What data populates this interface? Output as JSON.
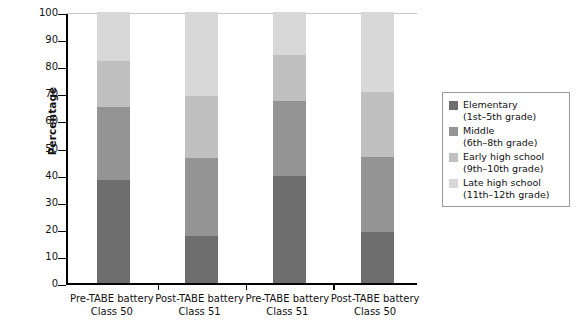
{
  "chart_data": {
    "type": "bar",
    "subtype": "stacked-percentage",
    "title": "",
    "xlabel": "",
    "ylabel": "Percentage",
    "ylim": [
      0,
      100
    ],
    "ytick_step": 10,
    "yticks": [
      0,
      10,
      20,
      30,
      40,
      50,
      60,
      70,
      80,
      90,
      100
    ],
    "ytick_labels": [
      "0",
      "10",
      "20",
      "30",
      "40",
      "50",
      "60",
      "70",
      "80",
      "90",
      "100"
    ],
    "grid": false,
    "legend_position": "right",
    "categories": [
      "Pre-TABE battery Class 50",
      "Post-TABE battery Class 51",
      "Pre-TABE battery Class 51",
      "Post-TABE battery Class 50"
    ],
    "category_lines": [
      [
        "Pre-TABE battery",
        "Class 50"
      ],
      [
        "Post-TABE battery",
        "Class 51"
      ],
      [
        "Pre-TABE battery",
        "Class 51"
      ],
      [
        "Post-TABE battery",
        "Class 50"
      ]
    ],
    "series": [
      {
        "name": "Elementary (1st–5th grade)",
        "color": "#6e6e6e",
        "values": [
          38,
          17.5,
          39.5,
          19
        ]
      },
      {
        "name": "Middle (6th–8th grade)",
        "color": "#949494",
        "values": [
          27,
          28.5,
          27.5,
          27.5
        ]
      },
      {
        "name": "Early high school (9th–10th grade)",
        "color": "#c0c0c0",
        "values": [
          17,
          23,
          17,
          24
        ]
      },
      {
        "name": "Late high school (11th–12th grade)",
        "color": "#d8d8d8",
        "values": [
          18,
          31,
          16,
          29.5
        ]
      }
    ]
  },
  "legend": {
    "items": [
      {
        "swatch_name": "legend-swatch-elementary",
        "color": "#6e6e6e",
        "line1": "Elementary",
        "line2": "(1st–5th grade)"
      },
      {
        "swatch_name": "legend-swatch-middle",
        "color": "#949494",
        "line1": "Middle",
        "line2": "(6th–8th grade)"
      },
      {
        "swatch_name": "legend-swatch-early-high",
        "color": "#c0c0c0",
        "line1": "Early high school",
        "line2": "(9th–10th grade)"
      },
      {
        "swatch_name": "legend-swatch-late-high",
        "color": "#d8d8d8",
        "line1": "Late high school",
        "line2": "(11th–12th grade)"
      }
    ]
  }
}
